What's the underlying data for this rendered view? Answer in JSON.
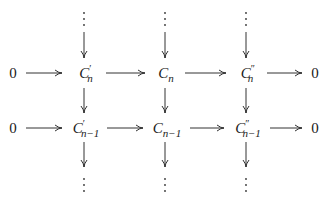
{
  "diagram": {
    "type": "commutative-diagram",
    "rows": [
      {
        "name": "row-n",
        "left_zero": "0",
        "nodes": [
          {
            "base": "C",
            "prime": "′",
            "sub": "n"
          },
          {
            "base": "C",
            "prime": "",
            "sub": "n"
          },
          {
            "base": "C",
            "prime": "″",
            "sub": "n"
          }
        ],
        "right_zero": "0"
      },
      {
        "name": "row-n-minus-1",
        "left_zero": "0",
        "nodes": [
          {
            "base": "C",
            "prime": "′",
            "sub": "n−1"
          },
          {
            "base": "C",
            "prime": "",
            "sub": "n−1"
          },
          {
            "base": "C",
            "prime": "″",
            "sub": "n−1"
          }
        ],
        "right_zero": "0"
      }
    ],
    "vertical_ellipsis": "⋮",
    "arrow_color": "#333333"
  }
}
